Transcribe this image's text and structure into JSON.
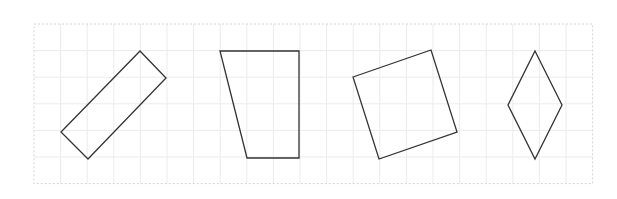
{
  "diagram": {
    "type": "shapes-on-grid",
    "grid": {
      "x0": 34,
      "y0": 24,
      "cell": 26.6,
      "cols": 21,
      "rows": 6,
      "line_color": "#ebebeb",
      "border_color": "#d4d4d4"
    },
    "stroke_color": "#333333",
    "shapes": [
      {
        "name": "rectangle-rotated",
        "points": [
          [
            140,
            51
          ],
          [
            166,
            78
          ],
          [
            88,
            159
          ],
          [
            61,
            132
          ]
        ]
      },
      {
        "name": "trapezoid",
        "points": [
          [
            220,
            51
          ],
          [
            299,
            51
          ],
          [
            299,
            158
          ],
          [
            247,
            158
          ]
        ]
      },
      {
        "name": "square-rotated",
        "points": [
          [
            353,
            77
          ],
          [
            431,
            50
          ],
          [
            457,
            132
          ],
          [
            379,
            159
          ]
        ]
      },
      {
        "name": "rhombus",
        "points": [
          [
            535,
            51
          ],
          [
            562,
            105
          ],
          [
            535,
            159
          ],
          [
            508,
            105
          ]
        ]
      }
    ]
  }
}
